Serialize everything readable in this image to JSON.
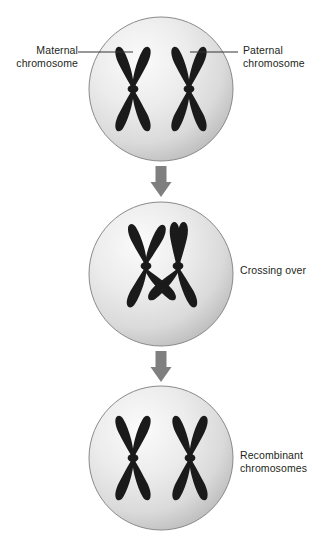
{
  "figure": {
    "type": "biology-diagram",
    "background_color": "#ffffff"
  },
  "labels": {
    "maternal": "Maternal\nchromosome",
    "paternal": "Paternal\nchromosome",
    "crossing_over": "Crossing over",
    "recombinant": "Recombinant\nchromosomes"
  },
  "cells": [
    {
      "name": "cell-top",
      "stage": "before-crossing-over",
      "center": [
        161,
        89
      ],
      "radius": 72,
      "chromosomes": [
        {
          "name": "maternal-chromosome",
          "center_x": 133,
          "shading": "solid-dark"
        },
        {
          "name": "paternal-chromosome",
          "center_x": 189,
          "shading": "solid-dark"
        }
      ]
    },
    {
      "name": "cell-middle",
      "stage": "crossing-over",
      "center": [
        161,
        274
      ],
      "radius": 72,
      "chromosomes": [
        {
          "name": "maternal-chromosome",
          "center_x": 146,
          "shading": "solid-dark"
        },
        {
          "name": "paternal-chromosome",
          "center_x": 178,
          "shading": "solid-dark"
        }
      ],
      "chiasma": {
        "name": "chiasma-crossover-point",
        "x": 162,
        "y": 305
      }
    },
    {
      "name": "cell-bottom",
      "stage": "after-crossing-over",
      "center": [
        161,
        458
      ],
      "radius": 72,
      "chromosomes": [
        {
          "name": "recombinant-chromosome-left",
          "center_x": 133,
          "shading": "solid-dark"
        },
        {
          "name": "recombinant-chromosome-right",
          "center_x": 190,
          "shading": "solid-dark"
        }
      ]
    }
  ],
  "arrows": [
    {
      "name": "arrow-top-to-middle",
      "x": 161,
      "y_start": 166,
      "y_end": 197,
      "direction": "down"
    },
    {
      "name": "arrow-middle-to-bottom",
      "x": 161,
      "y_start": 351,
      "y_end": 382,
      "direction": "down"
    }
  ],
  "leader_lines": [
    {
      "name": "leader-line-maternal",
      "x_start": 78,
      "x_end": 133,
      "y": 52
    },
    {
      "name": "leader-line-paternal",
      "x_start": 189,
      "x_end": 238,
      "y": 52
    }
  ],
  "colors": {
    "chromosome": "#1a1a1a",
    "cell_fill_light": "#f2f2f2",
    "cell_fill_mid": "#dcdcdc",
    "cell_fill_dark": "#bdbdbd",
    "cell_outline": "#8a8a8a",
    "arrow": "#7f7f7f",
    "text": "#231f20",
    "leader_line": "#333333"
  }
}
